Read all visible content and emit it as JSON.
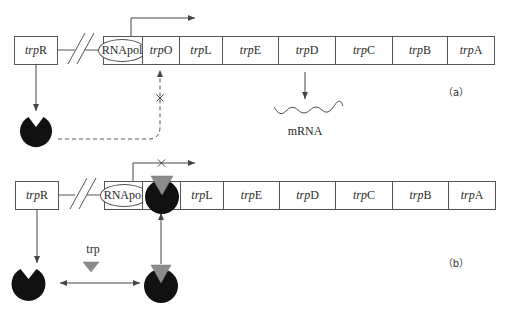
{
  "panels": [
    {
      "id": "a",
      "label": "（a）",
      "regulator_gene": {
        "prefix": "trp",
        "suffix": "R"
      },
      "promoter_label": "RNApol",
      "genes": [
        {
          "prefix": "trp",
          "suffix": "O"
        },
        {
          "prefix": "trp",
          "suffix": "L"
        },
        {
          "prefix": "trp",
          "suffix": "E"
        },
        {
          "prefix": "trp",
          "suffix": "D"
        },
        {
          "prefix": "trp",
          "suffix": "C"
        },
        {
          "prefix": "trp",
          "suffix": "B"
        },
        {
          "prefix": "trp",
          "suffix": "A"
        }
      ],
      "transcription": "active",
      "mrna_label": "mRNA",
      "repressor_binding_blocked_mark": "×"
    },
    {
      "id": "b",
      "label": "（b）",
      "regulator_gene": {
        "prefix": "trp",
        "suffix": "R"
      },
      "promoter_label": "RNApol",
      "genes": [
        {
          "prefix": "trp",
          "suffix": "O"
        },
        {
          "prefix": "trp",
          "suffix": "L"
        },
        {
          "prefix": "trp",
          "suffix": "E"
        },
        {
          "prefix": "trp",
          "suffix": "D"
        },
        {
          "prefix": "trp",
          "suffix": "C"
        },
        {
          "prefix": "trp",
          "suffix": "B"
        },
        {
          "prefix": "trp",
          "suffix": "A"
        }
      ],
      "transcription": "blocked",
      "transcription_blocked_mark": "×",
      "corepressor_label": "trp"
    }
  ],
  "colors": {
    "line": "#444444",
    "repressor": "#111111",
    "tryptophan": "#8c8c8c",
    "box_border": "#555555"
  }
}
